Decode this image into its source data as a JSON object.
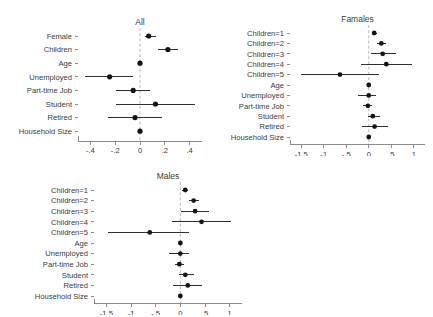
{
  "figure": {
    "background": "#ffffff",
    "marker_color": "#141414",
    "line_color": "#1a1a1a",
    "zero_line_color": "#b9b9b9",
    "axis_color": "#6f6f6f"
  },
  "chart_data": [
    {
      "type": "scatter",
      "subtype": "forest-plot",
      "panel_id": "all",
      "title": "All",
      "xlabel": "",
      "ylabel": "",
      "xlim": [
        -0.5,
        0.5
      ],
      "xticks": [
        -0.4,
        -0.2,
        0,
        0.2,
        0.4
      ],
      "xtick_labels": [
        "-.4",
        "-.2",
        "0",
        ".2",
        ".4"
      ],
      "grid": false,
      "legend": "none",
      "reference_line": 0,
      "categories": [
        "Female",
        "Children",
        "Age",
        "Unemployed",
        "Part-time Job",
        "Student",
        "Retired",
        "Household Size"
      ],
      "estimates": [
        0.07,
        0.225,
        0.0,
        -0.245,
        -0.055,
        0.125,
        -0.04,
        0.0
      ],
      "ci_low": [
        0.04,
        0.145,
        -0.005,
        -0.445,
        -0.195,
        -0.19,
        -0.26,
        -0.02
      ],
      "ci_high": [
        0.125,
        0.305,
        0.005,
        -0.055,
        0.08,
        0.445,
        0.175,
        0.02
      ]
    },
    {
      "type": "scatter",
      "subtype": "forest-plot",
      "panel_id": "females",
      "title": "Famales",
      "xlabel": "",
      "ylabel": "",
      "xlim": [
        -1.75,
        1.25
      ],
      "xticks": [
        -1.5,
        -1,
        -0.5,
        0,
        0.5,
        1
      ],
      "xtick_labels": [
        "-1.5",
        "-1",
        "-.5",
        "0",
        ".5",
        "1"
      ],
      "grid": false,
      "legend": "none",
      "reference_line": 0,
      "categories": [
        "Children=1",
        "Children=2",
        "Children=3",
        "Children=4",
        "Children=5",
        "Age",
        "Unemployed",
        "Part-time Job",
        "Student",
        "Retired",
        "Household Size"
      ],
      "estimates": [
        0.12,
        0.28,
        0.31,
        0.39,
        -0.64,
        0.0,
        0.0,
        -0.02,
        0.09,
        0.13,
        0.0
      ],
      "ci_low": [
        0.07,
        0.19,
        0.04,
        -0.17,
        -1.5,
        -0.02,
        -0.23,
        -0.12,
        -0.02,
        -0.16,
        -0.03
      ],
      "ci_high": [
        0.18,
        0.38,
        0.6,
        0.97,
        0.22,
        0.02,
        0.17,
        0.07,
        0.25,
        0.43,
        0.03
      ]
    },
    {
      "type": "scatter",
      "subtype": "forest-plot",
      "panel_id": "males",
      "title": "Males",
      "xlabel": "",
      "ylabel": "",
      "xlim": [
        -1.75,
        1.25
      ],
      "xticks": [
        -1.5,
        -1,
        -0.5,
        0,
        0.5,
        1
      ],
      "xtick_labels": [
        "-1.5",
        "-1",
        "-.5",
        "0",
        ".5",
        "1"
      ],
      "grid": false,
      "legend": "none",
      "reference_line": 0,
      "categories": [
        "Children=1",
        "Children=2",
        "Children=3",
        "Children=4",
        "Children=5",
        "Age",
        "Unemployed",
        "Part-time Job",
        "Student",
        "Retired",
        "Household Size"
      ],
      "estimates": [
        0.1,
        0.27,
        0.3,
        0.43,
        -0.62,
        0.0,
        0.0,
        -0.02,
        0.1,
        0.15,
        0.0
      ],
      "ci_low": [
        0.04,
        0.18,
        0.02,
        -0.17,
        -1.47,
        -0.02,
        -0.22,
        -0.11,
        -0.02,
        -0.15,
        -0.03
      ],
      "ci_high": [
        0.16,
        0.37,
        0.58,
        1.03,
        0.17,
        0.02,
        0.18,
        0.07,
        0.27,
        0.44,
        0.03
      ]
    }
  ]
}
